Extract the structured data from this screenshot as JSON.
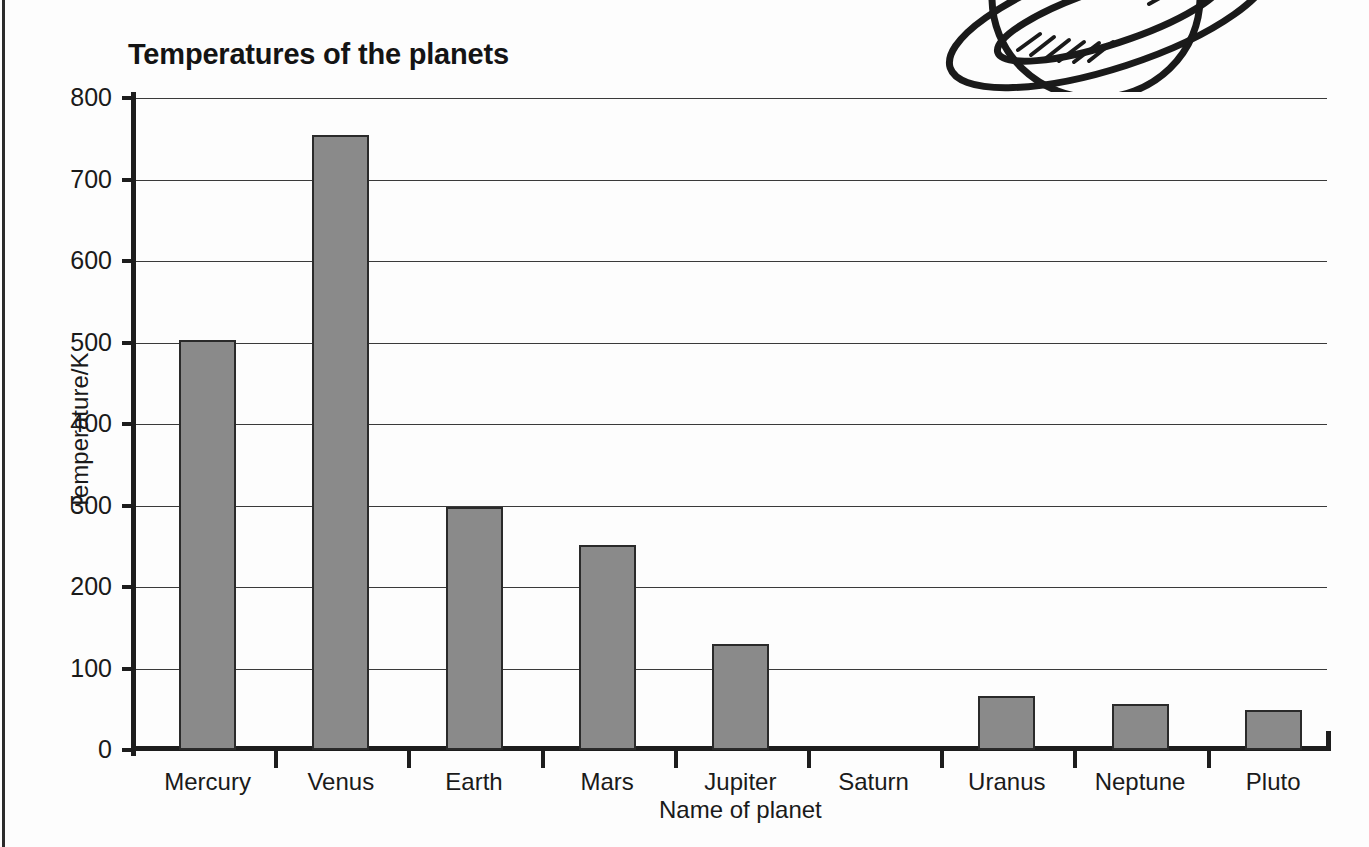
{
  "figure": {
    "title": "Temperatures of the planets",
    "illustration": "saturn-ringed-planet-line-drawing"
  },
  "chart_data": {
    "type": "bar",
    "title": "Temperatures of the planets",
    "xlabel": "Name of planet",
    "ylabel": "Temperature/K",
    "categories": [
      "Mercury",
      "Venus",
      "Earth",
      "Mars",
      "Jupiter",
      "Saturn",
      "Uranus",
      "Neptune",
      "Pluto"
    ],
    "values": [
      503,
      755,
      298,
      252,
      130,
      0,
      66,
      57,
      49
    ],
    "ylim": [
      0,
      800
    ],
    "ytick_labels": [
      "0",
      "100",
      "200",
      "300",
      "400",
      "500",
      "600",
      "700",
      "800"
    ],
    "ytick_values": [
      0,
      100,
      200,
      300,
      400,
      500,
      600,
      700,
      800
    ],
    "grid": true,
    "legend": "none",
    "bar_fill": "#8a8a8a",
    "bar_edge": "#2a2a2a"
  }
}
